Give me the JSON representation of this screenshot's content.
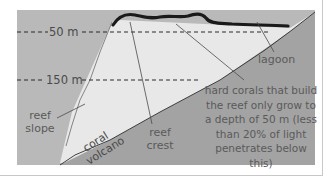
{
  "colors": {
    "sea": "#b9b9b9",
    "reef_body": "#e8e8e8",
    "volcano": "#a3a3a3",
    "coral_crust": "#1a1a1a",
    "text": "#4a4a4a",
    "pointer": "#4a4a4a"
  },
  "depth_markers": [
    {
      "label": "50 m"
    },
    {
      "label": "150 m"
    }
  ],
  "labels": {
    "lagoon": "lagoon",
    "reef_slope_line1": "reef",
    "reef_slope_line2": "slope",
    "reef_crest_line1": "reef",
    "reef_crest_line2": "crest",
    "coral": "coral",
    "volcano": "volcano",
    "note_lines": [
      "hard corals that build",
      "the reef only grow to",
      "a depth of 50 m (less",
      "than 20% of light",
      "penetrates below",
      "this)"
    ]
  }
}
